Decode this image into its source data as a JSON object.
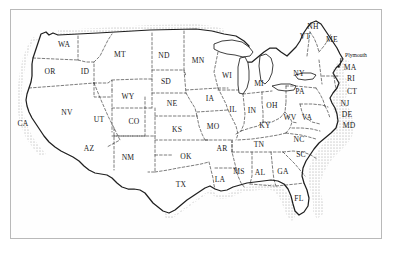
{
  "figure": {
    "kind": "map",
    "projection_note": "contiguous 48 states",
    "background_color": "#ffffff",
    "frame_color": "#b9b9b9",
    "ink_color": "#1a1a1a",
    "coast_shading_color": "#2b2b2b",
    "border_style": "dashed interior state boundaries, stippled/hatched coastline"
  },
  "labels": {
    "states": [
      {
        "abbr": "WA",
        "x": 64,
        "y": 45
      },
      {
        "abbr": "OR",
        "x": 50,
        "y": 72
      },
      {
        "abbr": "ID",
        "x": 85,
        "y": 72
      },
      {
        "abbr": "MT",
        "x": 120,
        "y": 55
      },
      {
        "abbr": "ND",
        "x": 164,
        "y": 56
      },
      {
        "abbr": "MN",
        "x": 198,
        "y": 61
      },
      {
        "abbr": "SD",
        "x": 166,
        "y": 82
      },
      {
        "abbr": "WI",
        "x": 227,
        "y": 76
      },
      {
        "abbr": "MI",
        "x": 259,
        "y": 84
      },
      {
        "abbr": "NV",
        "x": 67,
        "y": 113
      },
      {
        "abbr": "UT",
        "x": 99,
        "y": 120
      },
      {
        "abbr": "WY",
        "x": 128,
        "y": 97
      },
      {
        "abbr": "NE",
        "x": 172,
        "y": 104
      },
      {
        "abbr": "IA",
        "x": 210,
        "y": 99
      },
      {
        "abbr": "IL",
        "x": 233,
        "y": 110
      },
      {
        "abbr": "IN",
        "x": 252,
        "y": 111
      },
      {
        "abbr": "OH",
        "x": 272,
        "y": 106
      },
      {
        "abbr": "PA",
        "x": 300,
        "y": 92
      },
      {
        "abbr": "NY",
        "x": 299,
        "y": 74
      },
      {
        "abbr": "CA",
        "x": 23,
        "y": 124
      },
      {
        "abbr": "CO",
        "x": 134,
        "y": 122
      },
      {
        "abbr": "KS",
        "x": 177,
        "y": 130
      },
      {
        "abbr": "MO",
        "x": 213,
        "y": 127
      },
      {
        "abbr": "KY",
        "x": 265,
        "y": 126
      },
      {
        "abbr": "WV",
        "x": 290,
        "y": 118
      },
      {
        "abbr": "VA",
        "x": 307,
        "y": 118
      },
      {
        "abbr": "AZ",
        "x": 89,
        "y": 149
      },
      {
        "abbr": "NM",
        "x": 128,
        "y": 158
      },
      {
        "abbr": "OK",
        "x": 186,
        "y": 157
      },
      {
        "abbr": "AR",
        "x": 222,
        "y": 149
      },
      {
        "abbr": "TN",
        "x": 259,
        "y": 145
      },
      {
        "abbr": "NC",
        "x": 299,
        "y": 140
      },
      {
        "abbr": "SC",
        "x": 301,
        "y": 155
      },
      {
        "abbr": "TX",
        "x": 181,
        "y": 185
      },
      {
        "abbr": "LA",
        "x": 220,
        "y": 180
      },
      {
        "abbr": "MS",
        "x": 239,
        "y": 172
      },
      {
        "abbr": "AL",
        "x": 260,
        "y": 173
      },
      {
        "abbr": "GA",
        "x": 283,
        "y": 172
      },
      {
        "abbr": "FL",
        "x": 299,
        "y": 199
      },
      {
        "abbr": "NH",
        "x": 313,
        "y": 27
      },
      {
        "abbr": "VT",
        "x": 305,
        "y": 37
      },
      {
        "abbr": "ME",
        "x": 332,
        "y": 40
      },
      {
        "abbr": "MA",
        "x": 350,
        "y": 68
      },
      {
        "abbr": "RI",
        "x": 351,
        "y": 79
      },
      {
        "abbr": "CT",
        "x": 352,
        "y": 92
      },
      {
        "abbr": "NJ",
        "x": 345,
        "y": 104
      },
      {
        "abbr": "DE",
        "x": 347,
        "y": 115
      },
      {
        "abbr": "MD",
        "x": 349,
        "y": 126
      }
    ],
    "cities": [
      {
        "name": "Plymouth",
        "label_x": 356,
        "label_y": 56,
        "dot_x": 339,
        "dot_y": 67
      }
    ]
  }
}
